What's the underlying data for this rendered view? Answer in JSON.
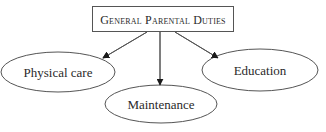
{
  "diagram": {
    "root": {
      "label": "General Parental Duties"
    },
    "children": [
      {
        "label": "Physical care"
      },
      {
        "label": "Maintenance"
      },
      {
        "label": "Education"
      }
    ],
    "colors": {
      "stroke": "#555555",
      "text": "#2a2a2a",
      "background": "#ffffff"
    }
  }
}
